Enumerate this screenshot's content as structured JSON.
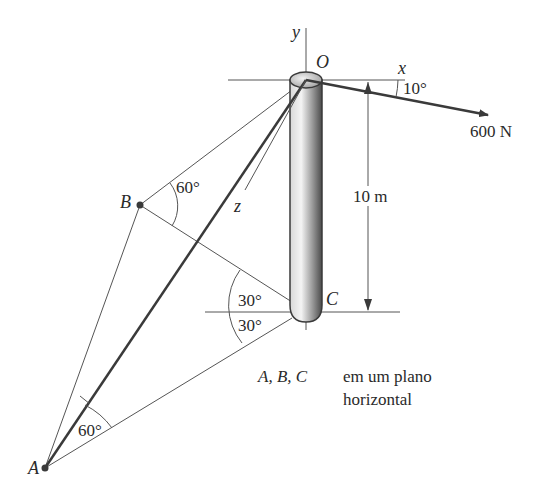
{
  "diagram": {
    "points": {
      "O": "O",
      "A": "A",
      "B": "B",
      "C": "C"
    },
    "axes": {
      "x": "x",
      "y": "y",
      "z": "z"
    },
    "force": {
      "magnitude_label": "600 N",
      "angle_label": "10°"
    },
    "height_label": "10 m",
    "angles": {
      "at_B": "60°",
      "at_A": "60°",
      "at_C_upper": "30°",
      "at_C_lower": "30°"
    },
    "note": {
      "points_label": "A, B, C",
      "line1": "em um plano",
      "line2": "horizontal"
    },
    "colors": {
      "line": "#3a3a3a",
      "pole_dark": "#555555",
      "pole_light": "#e8e8e8"
    }
  }
}
